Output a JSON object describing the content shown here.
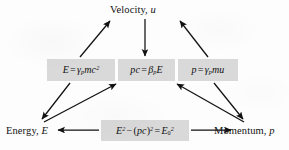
{
  "figure": {
    "type": "relationship-diagram",
    "background_color": "#fdfdfd",
    "box_fill_color": "#d9d9d9",
    "ink_color": "#111111"
  },
  "nodes": {
    "velocity": {
      "label": "Velocity,",
      "symbol": "u"
    },
    "energy": {
      "label": "Energy,",
      "symbol": "E"
    },
    "momentum": {
      "label": "Momentum,",
      "symbol": "p"
    }
  },
  "formulas": {
    "energy_gamma": {
      "id": "E = γ_p mc²",
      "lhs": "E",
      "relation": "=",
      "gamma": "γ",
      "gamma_subscript": "p",
      "mass": "m",
      "c": "c",
      "c_exponent": "2"
    },
    "pc_beta": {
      "id": "pc = β_p E",
      "lhs_p": "p",
      "lhs_c": "c",
      "relation": "=",
      "beta": "β",
      "beta_subscript": "p",
      "rhs_E": "E"
    },
    "p_gamma": {
      "id": "p = γ_p mu",
      "lhs": "p",
      "relation": "=",
      "gamma": "γ",
      "gamma_subscript": "p",
      "mass": "m",
      "velocity": "u"
    },
    "invariant": {
      "id": "E² − (pc)² = E₀²",
      "E": "E",
      "E_exponent": "2",
      "minus": "−",
      "open_paren": "(",
      "p": "p",
      "c": "c",
      "close_paren": ")",
      "paren_exponent": "2",
      "relation": "=",
      "E_rest": "E",
      "rest_subscript": "0",
      "rest_exponent": "2"
    }
  },
  "arrows": [
    {
      "name": "energy-gamma-box-to-velocity",
      "from": "E = γ_p mc²",
      "to": "Velocity, u",
      "direction": "up-right"
    },
    {
      "name": "velocity-to-pc-beta-box",
      "from": "Velocity, u",
      "to": "pc = β_p E",
      "direction": "down"
    },
    {
      "name": "p-gamma-box-to-velocity",
      "from": "p = γ_p mu",
      "to": "Velocity, u",
      "direction": "up-left"
    },
    {
      "name": "energy-gamma-box-to-energy",
      "from": "E = γ_p mc²",
      "to": "Energy, E",
      "direction": "down-left"
    },
    {
      "name": "energy-to-pc-beta-box",
      "from": "Energy, E",
      "to": "pc = β_p E",
      "direction": "up-right"
    },
    {
      "name": "momentum-to-pc-beta-box",
      "from": "Momentum, p",
      "to": "pc = β_p E",
      "direction": "up-left"
    },
    {
      "name": "p-gamma-box-to-momentum",
      "from": "p = γ_p mu",
      "to": "Momentum, p",
      "direction": "down-right"
    },
    {
      "name": "invariant-box-to-energy",
      "from": "E² − (pc)² = E₀²",
      "to": "Energy, E",
      "direction": "left"
    },
    {
      "name": "invariant-box-to-momentum",
      "from": "E² − (pc)² = E₀²",
      "to": "Momentum, p",
      "direction": "right"
    }
  ]
}
